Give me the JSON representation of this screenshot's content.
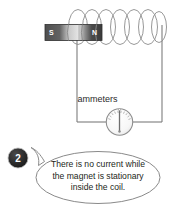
{
  "figure": {
    "type": "physics-circuit-diagram"
  },
  "magnet": {
    "south_pole_label": "S",
    "north_pole_label": "N",
    "body_color": "#565656",
    "mid_color": "#d8d8d8",
    "label_color": "#ffffff"
  },
  "coil": {
    "loop_count": 7,
    "stroke_color": "#8c8c8c"
  },
  "circuit": {
    "wire_color": "#7d7d7d"
  },
  "ammeter": {
    "caption": "ammeters",
    "needle_position": "zero-center",
    "dial_color": "#9a9a9a",
    "face_color": "#fdfdfd"
  },
  "callout": {
    "badge_number": "2",
    "badge_color": "#262626",
    "bubble_stroke": "#8a8a8a",
    "lines": [
      "There is no current while",
      "the magnet is stationary",
      "inside the coil."
    ],
    "text": "There is no current while the magnet is stationary inside the coil."
  }
}
